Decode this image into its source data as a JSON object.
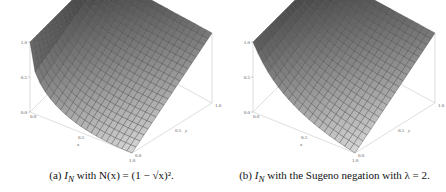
{
  "figure": {
    "panels": [
      {
        "id": "a",
        "caption_prefix": "(a)",
        "caption_symbol": "I",
        "caption_subscript": "N",
        "caption_text": " with N(x) = (1 − √x)².",
        "negation": "N(x) = (1 - sqrt(x))^2"
      },
      {
        "id": "b",
        "caption_prefix": "(b)",
        "caption_symbol": "I",
        "caption_subscript": "N",
        "caption_text": " with the Sugeno negation with λ = 2.",
        "negation": "Sugeno, lambda = 2"
      }
    ]
  },
  "chart_data": [
    {
      "type": "surface3d",
      "title": "(a) I_N with N(x) = (1 - sqrt(x))^2",
      "xlabel": "x",
      "ylabel": "y",
      "zlabel": "",
      "xlim": [
        0.0,
        1.0
      ],
      "ylim": [
        0.0,
        1.0
      ],
      "zlim": [
        0.0,
        1.0
      ],
      "x_ticks": [
        "0.0",
        "0.5",
        "1.0"
      ],
      "y_ticks": [
        "0.0",
        "0.5",
        "1.0"
      ],
      "z_ticks": [
        "0.0",
        "0.5",
        "1.0"
      ],
      "mesh": 20,
      "color": "#8a8a8a"
    },
    {
      "type": "surface3d",
      "title": "(b) I_N with the Sugeno negation with lambda = 2",
      "xlabel": "x",
      "ylabel": "y",
      "zlabel": "",
      "xlim": [
        0.0,
        1.0
      ],
      "ylim": [
        0.0,
        1.0
      ],
      "zlim": [
        0.0,
        1.0
      ],
      "x_ticks": [
        "0.0",
        "0.5",
        "1.0"
      ],
      "y_ticks": [
        "0.0",
        "0.5",
        "1.0"
      ],
      "z_ticks": [
        "0.0",
        "0.5",
        "1.0"
      ],
      "mesh": 20,
      "color": "#8a8a8a"
    }
  ]
}
